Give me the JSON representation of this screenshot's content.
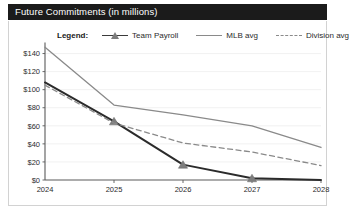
{
  "header": {
    "title": "Future Commitments (in millions)"
  },
  "legend": {
    "title_label": "Legend:",
    "entries": [
      {
        "label": "Team Payroll",
        "style": "line-marker",
        "color": "#2b2b2b",
        "marker": "triangle-marker"
      },
      {
        "label": "MLB avg",
        "style": "solid",
        "color": "#8a8a8a",
        "marker": "none"
      },
      {
        "label": "Division avg",
        "style": "dashed",
        "color": "#8a8a8a",
        "marker": "none"
      }
    ]
  },
  "chart_data": {
    "type": "line",
    "title": "Future Commitments (in millions)",
    "xlabel": "",
    "ylabel": "",
    "categories": [
      "2024",
      "2025",
      "2026",
      "2027",
      "2028"
    ],
    "x": [
      2024,
      2025,
      2026,
      2027,
      2028
    ],
    "xlim": [
      2024,
      2028
    ],
    "ylim": [
      0,
      150
    ],
    "yticks": [
      0,
      20,
      40,
      60,
      80,
      100,
      120,
      140
    ],
    "ytick_labels": [
      "$0",
      "$20",
      "$40",
      "$60",
      "$80",
      "$100",
      "$120",
      "$140"
    ],
    "xtick_labels": [
      "2024",
      "2025",
      "2026",
      "2027",
      "2028"
    ],
    "grid": true,
    "grid_axis": "y",
    "legend_position": "top",
    "value_prefix": "$",
    "value_unit": "millions",
    "series": [
      {
        "name": "Team Payroll",
        "color": "#2b2b2b",
        "style": "solid",
        "marker": "triangle",
        "width": 2.0,
        "values": [
          108,
          65,
          17,
          2,
          0
        ]
      },
      {
        "name": "MLB avg",
        "color": "#8a8a8a",
        "style": "solid",
        "marker": "none",
        "width": 1.3,
        "values": [
          147,
          83,
          72,
          60,
          36
        ]
      },
      {
        "name": "Division avg",
        "color": "#8a8a8a",
        "style": "dashed",
        "marker": "none",
        "width": 1.3,
        "values": [
          105,
          63,
          41,
          31,
          16
        ]
      }
    ]
  }
}
